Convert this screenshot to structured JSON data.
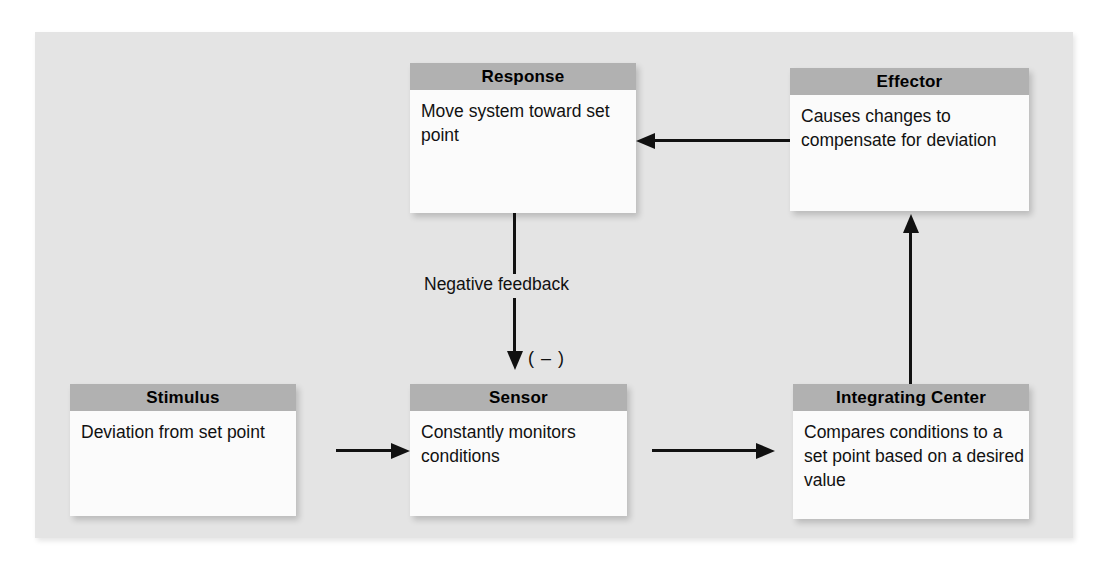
{
  "diagram": {
    "panel_color": "#e4e4e4",
    "header_color": "#b1b1b1",
    "body_color": "#fbfbfb",
    "line_color": "#111111",
    "boxes": [
      {
        "id": "response",
        "header": "Response",
        "body": "Move system toward set point"
      },
      {
        "id": "effector",
        "header": "Effector",
        "body": "Causes changes to compensate for deviation"
      },
      {
        "id": "stimulus",
        "header": "Stimulus",
        "body": "Deviation from set point"
      },
      {
        "id": "sensor",
        "header": "Sensor",
        "body": "Constantly monitors conditions"
      },
      {
        "id": "integrating_center",
        "header": "Integrating Center",
        "body": "Compares conditions to a set point based on a desired value"
      }
    ],
    "labels": {
      "negative_feedback": "Negative feedback",
      "minus_sign": "( – )"
    },
    "arrows": [
      {
        "id": "effector-to-response",
        "direction": "left"
      },
      {
        "id": "response-to-sensor",
        "direction": "down"
      },
      {
        "id": "stimulus-to-sensor",
        "direction": "right"
      },
      {
        "id": "sensor-to-integrating-center",
        "direction": "right"
      },
      {
        "id": "integrating-center-to-effector",
        "direction": "up"
      }
    ]
  }
}
